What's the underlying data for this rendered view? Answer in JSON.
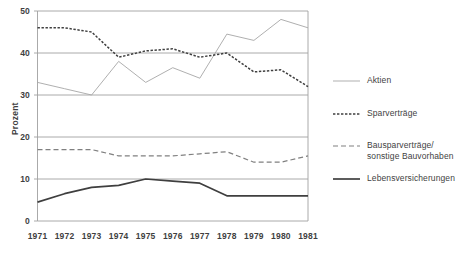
{
  "chart_data": {
    "type": "line",
    "title": "",
    "xlabel": "",
    "ylabel": "Prozent",
    "categories": [
      "1971",
      "1972",
      "1973",
      "1974",
      "1975",
      "1976",
      "1977",
      "1978",
      "1979",
      "1980",
      "1981"
    ],
    "x": [
      1971,
      1972,
      1973,
      1974,
      1975,
      1976,
      1977,
      1978,
      1979,
      1980,
      1981
    ],
    "ylim": [
      0,
      50
    ],
    "yticks": [
      0,
      10,
      20,
      30,
      40,
      50
    ],
    "grid": "horizontal",
    "legend_position": "right",
    "series": [
      {
        "name": "Aktien",
        "style": "thin-solid",
        "color": "#a6a6a6",
        "values": [
          33,
          31.5,
          30,
          38,
          33,
          36.5,
          34,
          44.5,
          43,
          48,
          46
        ]
      },
      {
        "name": "Sparverträge",
        "style": "dotted",
        "color": "#3f3f3f",
        "values": [
          46,
          46,
          45,
          39,
          40.5,
          41,
          39,
          40,
          35.5,
          36,
          32
        ]
      },
      {
        "name": "Bausparverträge/ sonstige Bauvorhaben",
        "style": "dashed",
        "color": "#808080",
        "values": [
          17,
          17,
          17,
          15.5,
          15.5,
          15.5,
          16,
          16.5,
          14,
          14,
          15.5
        ]
      },
      {
        "name": "Lebensversicherungen",
        "style": "thick-solid",
        "color": "#3f3f3f",
        "values": [
          4.5,
          6.5,
          8,
          8.5,
          10,
          9.5,
          9,
          6,
          6,
          6,
          6
        ]
      }
    ]
  },
  "axis": {
    "y_title": "Prozent",
    "y_ticks": [
      "0",
      "10",
      "20",
      "30",
      "40",
      "50"
    ],
    "x_ticks": [
      "1971",
      "1972",
      "1973",
      "1974",
      "1975",
      "1976",
      "1977",
      "1978",
      "1979",
      "1980",
      "1981"
    ]
  },
  "legend": {
    "items": [
      {
        "label": "Aktien",
        "label2": "",
        "swatch": "thin-solid"
      },
      {
        "label": "Sparverträge",
        "label2": "",
        "swatch": "dotted"
      },
      {
        "label": "Bausparverträge/",
        "label2": "sonstige Bauvorhaben",
        "swatch": "dashed"
      },
      {
        "label": "Lebensversicherungen",
        "label2": "",
        "swatch": "thick-solid"
      }
    ]
  },
  "colors": {
    "aktien": "#a6a6a6",
    "sparvertraege": "#3f3f3f",
    "bausparvertraege": "#808080",
    "lebensversicherungen": "#3f3f3f",
    "grid": "#a0a0a0",
    "text": "#3f3f3f"
  }
}
